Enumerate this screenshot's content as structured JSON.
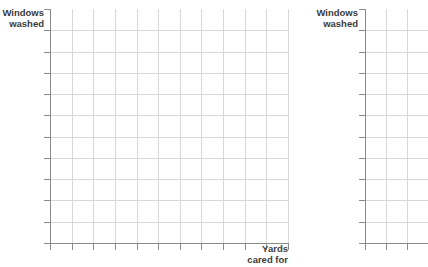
{
  "chart_data": [
    {
      "id": "primary",
      "type": "table",
      "title": "",
      "xlabel": "Yards\ncared for",
      "ylabel": "Windows\nwashed",
      "grid": true,
      "legend": "none",
      "series": [],
      "categories": [],
      "values": [],
      "xlim": [
        0,
        11
      ],
      "ylim": [
        0,
        11
      ],
      "x_gridline_count": 11,
      "y_gridline_count": 11,
      "x_tick_count": 12,
      "y_tick_count": 12,
      "note": "Empty plotting grid — no data plotted"
    },
    {
      "id": "secondary",
      "type": "table",
      "title": "",
      "xlabel": "",
      "ylabel": "Windows\nwashed",
      "grid": true,
      "legend": "none",
      "series": [],
      "categories": [],
      "values": [],
      "xlim": [
        0,
        3
      ],
      "ylim": [
        0,
        11
      ],
      "x_gridline_count": 3,
      "y_gridline_count": 11,
      "x_tick_count": 4,
      "y_tick_count": 12,
      "note": "Empty plotting grid — no data plotted, cropped at right edge"
    }
  ],
  "charts": {
    "primary": {
      "y_axis_label": "Windows\nwashed",
      "x_axis_label": "Yards\ncared for"
    },
    "secondary": {
      "y_axis_label": "Windows\nwashed"
    }
  },
  "colors": {
    "grid": "#d8d8d8",
    "axis": "#8a8a8a",
    "label_text": "#3b3b3b",
    "background": "#ffffff"
  }
}
